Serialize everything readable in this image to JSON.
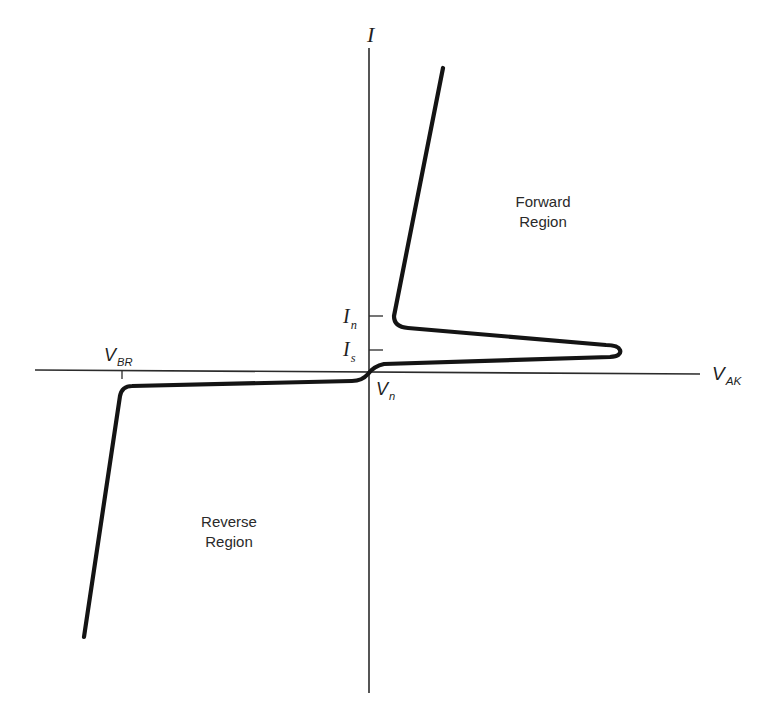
{
  "figure": {
    "type": "I-V characteristic curve",
    "axes": {
      "y_label": "I",
      "x_label_main": "V",
      "x_label_sub": "AK"
    },
    "markers": {
      "holding_current": {
        "main": "I",
        "sub": "n"
      },
      "switching_current": {
        "main": "I",
        "sub": "s"
      },
      "breakdown_voltage": {
        "main": "V",
        "sub": "BR"
      },
      "knee_voltage": {
        "main": "V",
        "sub": "n"
      }
    },
    "regions": {
      "forward": {
        "line1": "Forward",
        "line2": "Region"
      },
      "reverse": {
        "line1": "Reverse",
        "line2": "Region"
      }
    },
    "colors": {
      "curve": "#141414",
      "axis": "#2b2b2b",
      "background": "#ffffff"
    }
  }
}
